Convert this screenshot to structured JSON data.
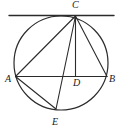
{
  "figure": {
    "kind": "circle-geometry-diagram",
    "type": "euclidean-plane-figure",
    "background_color": "#ffffff",
    "stroke_color": "#2b2b2b",
    "label_color": "#1a1a1a",
    "canvas": {
      "width": 122,
      "height": 132
    }
  },
  "circle": {
    "name": "main-circle",
    "center": {
      "x": 61,
      "y": 63
    },
    "radius": 47,
    "stroke_width": 1.2
  },
  "tangent_line": {
    "name": "tangent-at-c",
    "x1": 9,
    "y1": 15.5,
    "x2": 114,
    "y2": 15.5,
    "stroke_width": 1.4
  },
  "points": [
    {
      "id": "A",
      "label": "A",
      "x": 15.5,
      "y": 76.5,
      "label_x": 5,
      "label_y": 74
    },
    {
      "id": "B",
      "label": "B",
      "x": 107,
      "y": 76.5,
      "label_x": 109,
      "label_y": 74
    },
    {
      "id": "C",
      "label": "C",
      "x": 75.5,
      "y": 16,
      "label_x": 72,
      "label_y": 0
    },
    {
      "id": "D",
      "label": "D",
      "x": 75.5,
      "y": 76.5,
      "label_x": 73,
      "label_y": 78
    },
    {
      "id": "E",
      "label": "E",
      "x": 56,
      "y": 109,
      "label_x": 52,
      "label_y": 117
    }
  ],
  "segments": [
    {
      "name": "segment-AB",
      "from": "A",
      "to": "B",
      "label": "AB"
    },
    {
      "name": "segment-AC",
      "from": "A",
      "to": "C",
      "label": "AC"
    },
    {
      "name": "segment-CB",
      "from": "C",
      "to": "B",
      "label": "CB"
    },
    {
      "name": "segment-CD",
      "from": "C",
      "to": "D",
      "label": "CD"
    },
    {
      "name": "segment-CE",
      "from": "C",
      "to": "E",
      "label": "CE"
    },
    {
      "name": "segment-AE",
      "from": "A",
      "to": "E",
      "label": "AE"
    }
  ],
  "labels": {
    "a": "A",
    "b": "B",
    "c": "C",
    "d": "D",
    "e": "E"
  }
}
